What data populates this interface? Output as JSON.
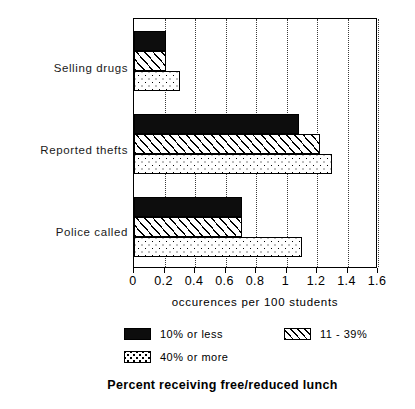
{
  "chart_data": {
    "type": "bar",
    "orientation": "horizontal",
    "title": "",
    "caption": "Percent receiving free/reduced lunch",
    "xlabel": "occurences per 100 students",
    "ylabel": "",
    "xlim": [
      0,
      1.6
    ],
    "xticks": [
      0,
      0.2,
      0.4,
      0.6,
      0.8,
      1,
      1.2,
      1.4,
      1.6
    ],
    "xticklabels": [
      "0",
      "0.2",
      "0.4",
      "0.6",
      "0.8",
      "1",
      "1.2",
      "1.4",
      "1.6"
    ],
    "grid": "vertical-dotted",
    "legend_position": "below-axis",
    "categories": [
      "Selling drugs",
      "Reported thefts",
      "Police called"
    ],
    "series": [
      {
        "name": "10% or less",
        "pattern": "solid-black",
        "values": [
          0.21,
          1.08,
          0.71
        ]
      },
      {
        "name": "11 - 39%",
        "pattern": "diagonal-hatch",
        "values": [
          0.21,
          1.22,
          0.71
        ]
      },
      {
        "name": "40% or more",
        "pattern": "dotted-stipple",
        "values": [
          0.3,
          1.3,
          1.1
        ]
      }
    ]
  },
  "axis": {
    "x_title": "occurences per 100 students",
    "tick_0": "0",
    "tick_1": "0.2",
    "tick_2": "0.4",
    "tick_3": "0.6",
    "tick_4": "0.8",
    "tick_5": "1",
    "tick_6": "1.2",
    "tick_7": "1.4",
    "tick_8": "1.6"
  },
  "categories": {
    "cat_0": "Selling drugs",
    "cat_1": "Reported thefts",
    "cat_2": "Police called"
  },
  "legend": {
    "item_0": "10% or less",
    "item_1": "11 - 39%",
    "item_2": "40% or more"
  },
  "footer": {
    "caption": "Percent receiving free/reduced lunch"
  },
  "colors": {
    "ink": "#000000",
    "series_1_fill": "#0d0d0d",
    "background": "#ffffff"
  }
}
